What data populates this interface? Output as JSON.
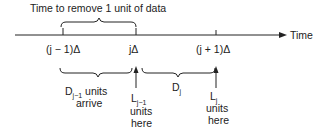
{
  "title": "Time to remove 1 unit of data",
  "axis": {
    "label": "Time"
  },
  "ticks": [
    {
      "label": "(j − 1)Δ"
    },
    {
      "label": "jΔ"
    },
    {
      "label": "(j + 1)Δ"
    }
  ],
  "arrivals": [
    {
      "main": "D",
      "sub": "j−1",
      "suffix": " units",
      "line2": "arrive"
    },
    {
      "main": "D",
      "sub": "j"
    }
  ],
  "levels": [
    {
      "main": "L",
      "sub": "j−1",
      "line2": "units",
      "line3": "here"
    },
    {
      "main": "L",
      "sub": "j",
      "line2": "units",
      "line3": "here"
    }
  ]
}
